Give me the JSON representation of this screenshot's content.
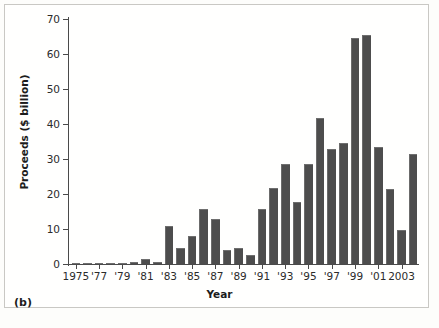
{
  "figure": {
    "panel_label": "(b)",
    "background_color": "#fdfdfb",
    "bar_color": "#4d4d4d",
    "axis_color": "#4a4a4a"
  },
  "chart_data": {
    "type": "bar",
    "title": "",
    "subtitle": "",
    "xlabel": "Year",
    "ylabel": "Proceeds ($ billion)",
    "ylim": [
      0,
      70
    ],
    "ytick_values": [
      0,
      10,
      20,
      30,
      40,
      50,
      60,
      70
    ],
    "ytick_labels": [
      "0",
      "10",
      "20",
      "30",
      "40",
      "50",
      "60",
      "70"
    ],
    "grid": false,
    "legend": null,
    "xtick_labels": [
      "1975",
      "'77",
      "'79",
      "'81",
      "'83",
      "'85",
      "'87",
      "'89",
      "'91",
      "'93",
      "'95",
      "'97",
      "'99",
      "'01",
      "2003"
    ],
    "xtick_years": [
      1975,
      1977,
      1979,
      1981,
      1983,
      1985,
      1987,
      1989,
      1991,
      1993,
      1995,
      1997,
      1999,
      2001,
      2003
    ],
    "categories": [
      1975,
      1976,
      1977,
      1978,
      1979,
      1980,
      1981,
      1982,
      1983,
      1984,
      1985,
      1986,
      1987,
      1988,
      1989,
      1990,
      1991,
      1992,
      1993,
      1994,
      1995,
      1996,
      1997,
      1998,
      1999,
      2000,
      2001,
      2002,
      2003
    ],
    "values": [
      0.2,
      0.2,
      0.2,
      0.3,
      0.3,
      0.6,
      1.4,
      0.6,
      11.0,
      4.5,
      8.0,
      15.8,
      13.0,
      3.9,
      4.6,
      2.5,
      15.7,
      21.7,
      28.6,
      17.8,
      28.5,
      41.8,
      32.8,
      34.7,
      64.5,
      65.5,
      33.5,
      21.5,
      9.7
    ],
    "extra_bar": {
      "label": "",
      "value": 31.5
    }
  }
}
